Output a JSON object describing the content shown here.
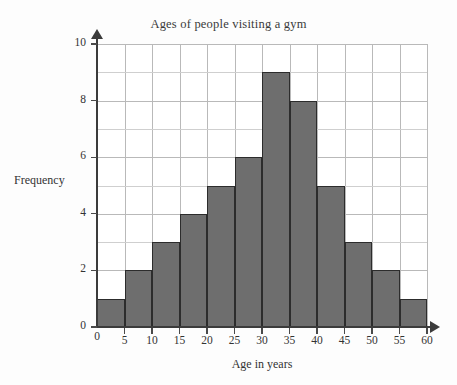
{
  "chart_data": {
    "type": "bar",
    "title": "Ages of people visiting a gym",
    "xlabel": "Age in years",
    "ylabel": "Frequency",
    "categories": [
      "0-5",
      "5-10",
      "10-15",
      "15-20",
      "20-25",
      "25-30",
      "30-35",
      "35-40",
      "40-45",
      "45-50",
      "50-55",
      "55-60"
    ],
    "bin_edges": [
      0,
      5,
      10,
      15,
      20,
      25,
      30,
      35,
      40,
      45,
      50,
      55,
      60
    ],
    "values": [
      1,
      2,
      3,
      4,
      5,
      6,
      9,
      8,
      5,
      3,
      2,
      1
    ],
    "xlim": [
      0,
      60
    ],
    "ylim": [
      0,
      10
    ],
    "x_tick_labels": [
      "0",
      "5",
      "10",
      "15",
      "20",
      "25",
      "30",
      "35",
      "40",
      "45",
      "50",
      "55",
      "60"
    ],
    "x_tick_values": [
      0,
      5,
      10,
      15,
      20,
      25,
      30,
      35,
      40,
      45,
      50,
      55,
      60
    ],
    "y_tick_labels": [
      "0",
      "2",
      "4",
      "6",
      "8",
      "10"
    ],
    "y_tick_values": [
      0,
      2,
      4,
      6,
      8,
      10
    ],
    "y_minor_step": 1,
    "grid": true,
    "legend": null,
    "bar_color": "#6e6e6e",
    "bar_edge_color": "#2c2c2c",
    "grid_color": "#b9b9b9",
    "axis_color": "#3b3b3b",
    "background_color": "#ffffff"
  },
  "watermark": {
    "text": "PiXL"
  }
}
